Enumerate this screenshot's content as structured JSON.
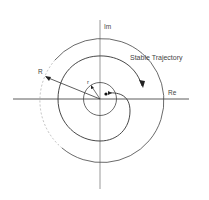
{
  "diagram": {
    "labels": {
      "im": "Im",
      "re": "Re",
      "stable_trajectory": "Stable Trajectory",
      "big_r": "R",
      "small_r": "r"
    },
    "colors": {
      "stroke": "#3a3a3a",
      "text": "#444444",
      "background": "#ffffff"
    }
  }
}
